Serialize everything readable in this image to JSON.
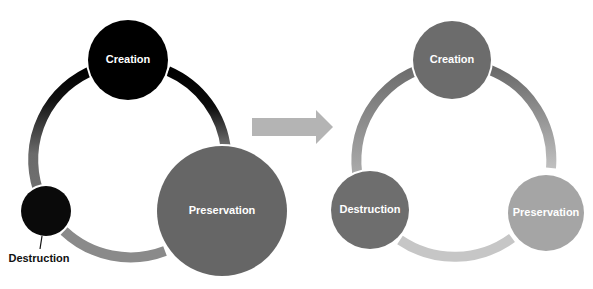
{
  "diagram": {
    "type": "cycle-comparison",
    "before": {
      "nodes": [
        {
          "id": "creation",
          "label": "Creation",
          "color": "#000000",
          "size": "medium"
        },
        {
          "id": "preservation",
          "label": "Preservation",
          "color": "#666666",
          "size": "large"
        },
        {
          "id": "destruction",
          "label": "Destruction",
          "color": "#0a0a0a",
          "size": "small",
          "label_position": "outside-below"
        }
      ],
      "ring": {
        "colors": [
          "#000000",
          "#6a6a6a",
          "#8a8a8a"
        ]
      }
    },
    "transition_arrow": {
      "color": "#b4b4b4",
      "direction": "right"
    },
    "after": {
      "nodes": [
        {
          "id": "creation",
          "label": "Creation",
          "color": "#6c6c6c",
          "size": "equal"
        },
        {
          "id": "preservation",
          "label": "Preservation",
          "color": "#a5a5a5",
          "size": "equal"
        },
        {
          "id": "destruction",
          "label": "Destruction",
          "color": "#6e6e6e",
          "size": "equal"
        }
      ],
      "ring": {
        "colors": [
          "#6e6e6e",
          "#b0b0b0",
          "#c6c6c6"
        ]
      }
    }
  }
}
